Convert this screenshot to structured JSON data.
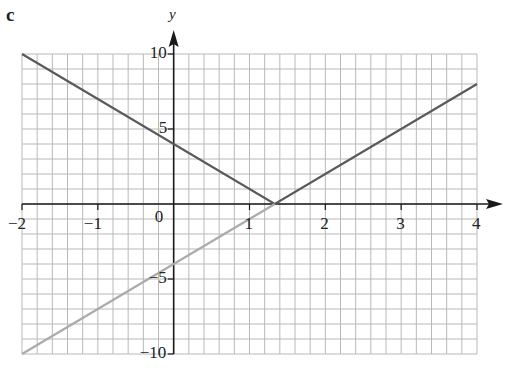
{
  "panel_label": "c",
  "colors": {
    "grid": "#b9b9b9",
    "axis": "#1a1a1a",
    "graph_dark": "#5a5a5a",
    "graph_light": "#ababab"
  },
  "chart_data": {
    "type": "line",
    "title": "",
    "xlabel": "",
    "ylabel": "y",
    "xlim": [
      -2,
      4
    ],
    "ylim": [
      -10,
      10
    ],
    "x_ticks": [
      "-2",
      "-1",
      "0",
      "1",
      "2",
      "3",
      "4"
    ],
    "y_ticks": [
      "10",
      "5",
      "-5",
      "-10"
    ],
    "grid": true,
    "grid_minor_x": 0.2,
    "grid_minor_y": 1,
    "series": [
      {
        "name": "y = |3x - 4|",
        "style": "dark",
        "points": [
          [
            -2,
            10
          ],
          [
            1.3333,
            0
          ],
          [
            4,
            8
          ]
        ]
      },
      {
        "name": "y = 3x - 4 (reflected part)",
        "style": "light",
        "points": [
          [
            -2,
            -10
          ],
          [
            1.3333,
            0
          ]
        ]
      }
    ]
  }
}
